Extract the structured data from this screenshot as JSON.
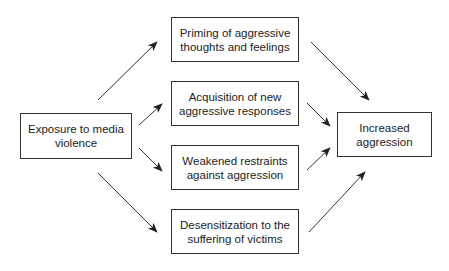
{
  "diagram": {
    "source": {
      "lines": [
        "Exposure to media",
        "violence"
      ]
    },
    "mediators": [
      {
        "lines": [
          "Priming of aggressive",
          "thoughts and feelings"
        ]
      },
      {
        "lines": [
          "Acquisition of new",
          "aggressive responses"
        ]
      },
      {
        "lines": [
          "Weakened restraints",
          "against aggression"
        ]
      },
      {
        "lines": [
          "Desensitization to the",
          "suffering of victims"
        ]
      }
    ],
    "outcome": {
      "lines": [
        "Increased",
        "aggression"
      ]
    },
    "colors": {
      "stroke": "#333333",
      "background": "#ffffff"
    }
  }
}
